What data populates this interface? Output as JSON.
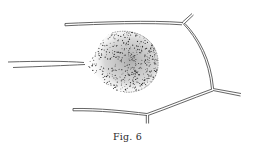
{
  "figure": {
    "caption": "Fig. 6",
    "colors": {
      "background": "#ffffff",
      "ink": "#4a4a4a",
      "stipple": "#2b2b2b"
    }
  }
}
